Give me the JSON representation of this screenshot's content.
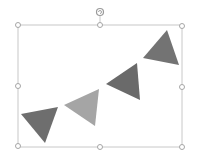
{
  "slide": {
    "background": "#ffffff",
    "shape": {
      "name": "bunting-garland",
      "selected": true,
      "selection_box": {
        "x": 18,
        "y": 25,
        "width": 164,
        "height": 122,
        "stroke": "#bfbfbf"
      },
      "handle_color": "#a6a6a6",
      "triangles": [
        {
          "points": "21,114 58,107 45,143",
          "fill": "#6e6e6e"
        },
        {
          "points": "64,105 99,89 95,126",
          "fill": "#a5a5a5"
        },
        {
          "points": "106,84 137,63 140,100",
          "fill": "#6a6a6a"
        },
        {
          "points": "143,58 167,30 179,65",
          "fill": "#737373"
        }
      ]
    }
  }
}
